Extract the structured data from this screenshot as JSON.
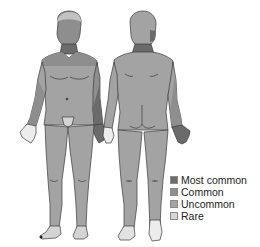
{
  "figures": {
    "front": {
      "label": "front-view"
    },
    "back": {
      "label": "back-view"
    }
  },
  "colors": {
    "most_common": "#6b6b6b",
    "common": "#8e8e8e",
    "uncommon": "#a3a3a3",
    "rare": "#d4d4d4",
    "outline": "#3a3a3a"
  },
  "legend": {
    "items": [
      {
        "label": "Most common",
        "color": "#6b6b6b"
      },
      {
        "label": "Common",
        "color": "#8e8e8e"
      },
      {
        "label": "Uncommon",
        "color": "#a3a3a3"
      },
      {
        "label": "Rare",
        "color": "#d4d4d4"
      }
    ]
  }
}
